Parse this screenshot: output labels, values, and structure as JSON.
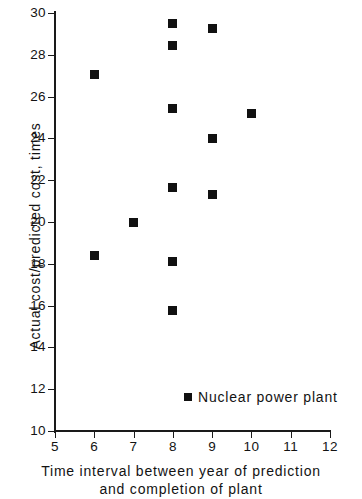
{
  "chart_data": {
    "type": "scatter",
    "title": "",
    "xlabel": "Time interval between year of prediction and completion of plant",
    "xlabel_line1": "Time interval between year of prediction",
    "xlabel_line2": "and completion of plant",
    "ylabel": "Actual cost/predicted cost, times",
    "xlim": [
      5,
      12
    ],
    "ylim": [
      10,
      30
    ],
    "xticks": [
      5,
      6,
      7,
      8,
      9,
      10,
      11,
      12
    ],
    "yticks": [
      10,
      12,
      14,
      16,
      18,
      20,
      22,
      24,
      26,
      28,
      30
    ],
    "xtick_labels": [
      "5",
      "6",
      "7",
      "8",
      "9",
      "10",
      "11",
      "12"
    ],
    "ytick_labels": [
      "10",
      "12",
      "14",
      "16",
      "18",
      "20",
      "22",
      "24",
      "26",
      "28",
      "30"
    ],
    "grid": false,
    "legend_position": "inside-lower-right",
    "marker_color": "#111111",
    "marker_shape": "square",
    "series": [
      {
        "name": "Nuclear power plant",
        "points": [
          {
            "x": 6,
            "y": 27.05
          },
          {
            "x": 6,
            "y": 18.4
          },
          {
            "x": 7,
            "y": 20.0
          },
          {
            "x": 8,
            "y": 29.5
          },
          {
            "x": 8,
            "y": 28.45
          },
          {
            "x": 8,
            "y": 25.45
          },
          {
            "x": 8,
            "y": 21.65
          },
          {
            "x": 8,
            "y": 18.1
          },
          {
            "x": 8,
            "y": 15.75
          },
          {
            "x": 9,
            "y": 29.25
          },
          {
            "x": 9,
            "y": 24.0
          },
          {
            "x": 9,
            "y": 21.3
          },
          {
            "x": 10,
            "y": 25.2
          }
        ]
      }
    ]
  },
  "legend": {
    "label": "Nuclear power plant"
  }
}
